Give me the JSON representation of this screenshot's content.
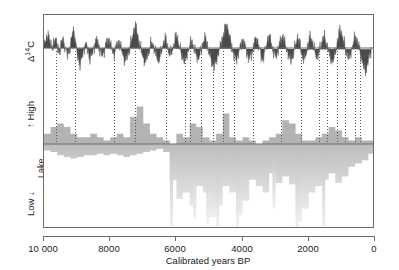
{
  "figure": {
    "name": "radiocarbon-lake-level-figure",
    "xaxis": {
      "title": "Calibrated years BP",
      "ticks": [
        "10 000",
        "8000",
        "6000",
        "4000",
        "2000",
        "0"
      ],
      "tick_values": [
        10000,
        8000,
        6000,
        4000,
        2000,
        0
      ],
      "reversed": true,
      "range": [
        10000,
        0
      ]
    },
    "yaxis": {
      "d14c_label_prefix": "Δ",
      "d14c_label_sup": "14",
      "d14c_label_suffix": "C",
      "high_label": "High",
      "low_label": "Low",
      "lake_label_line1": "Lake",
      "lake_label_line2": "level",
      "arrow_up": "↑",
      "arrow_down": "↓"
    },
    "colors": {
      "d14c": "#4a4a4a",
      "lake_high": "#b3b3b3",
      "lake_low_top": "#bdbdbd",
      "lake_low_bottom": "#f2f2f2",
      "frame": "#6b6b6b",
      "dotted_line": "#555555",
      "text": "#1a1a1a",
      "background": "#ffffff"
    }
  },
  "chart_data": {
    "type": "area",
    "title": "",
    "xlabel": "Calibrated years BP",
    "ylabel": "",
    "xlim": [
      10000,
      0
    ],
    "grid": false,
    "legend": "none",
    "panels": [
      {
        "name": "d14c-residual",
        "ylabel": "Δ14C",
        "type": "area",
        "color": "#4a4a4a",
        "baseline": 0,
        "note": "Atmospheric radiocarbon residual wiggles, positive up / negative down about zero line",
        "x": [
          10000,
          9950,
          9900,
          9850,
          9800,
          9750,
          9700,
          9650,
          9600,
          9550,
          9500,
          9450,
          9400,
          9350,
          9300,
          9250,
          9200,
          9150,
          9100,
          9050,
          9000,
          8950,
          8900,
          8850,
          8800,
          8750,
          8700,
          8650,
          8600,
          8550,
          8500,
          8450,
          8400,
          8350,
          8300,
          8250,
          8200,
          8150,
          8100,
          8050,
          8000,
          7950,
          7900,
          7850,
          7800,
          7750,
          7700,
          7650,
          7600,
          7550,
          7500,
          7450,
          7400,
          7350,
          7300,
          7250,
          7200,
          7150,
          7100,
          7050,
          7000,
          6950,
          6900,
          6850,
          6800,
          6750,
          6700,
          6650,
          6600,
          6550,
          6500,
          6450,
          6400,
          6350,
          6300,
          6250,
          6200,
          6150,
          6100,
          6050,
          6000,
          5950,
          5900,
          5850,
          5800,
          5750,
          5700,
          5650,
          5600,
          5550,
          5500,
          5450,
          5400,
          5350,
          5300,
          5250,
          5200,
          5150,
          5100,
          5050,
          5000,
          4950,
          4900,
          4850,
          4800,
          4750,
          4700,
          4650,
          4600,
          4550,
          4500,
          4450,
          4400,
          4350,
          4300,
          4250,
          4200,
          4150,
          4100,
          4050,
          4000,
          3950,
          3900,
          3850,
          3800,
          3750,
          3700,
          3650,
          3600,
          3550,
          3500,
          3450,
          3400,
          3350,
          3300,
          3250,
          3200,
          3150,
          3100,
          3050,
          3000,
          2950,
          2900,
          2850,
          2800,
          2750,
          2700,
          2650,
          2600,
          2550,
          2500,
          2450,
          2400,
          2350,
          2300,
          2250,
          2200,
          2150,
          2100,
          2050,
          2000,
          1950,
          1900,
          1850,
          1800,
          1750,
          1700,
          1650,
          1600,
          1550,
          1500,
          1450,
          1400,
          1350,
          1300,
          1250,
          1200,
          1150,
          1100,
          1050,
          1000,
          950,
          900,
          850,
          800,
          750,
          700,
          650,
          600,
          550,
          500,
          450,
          400,
          350,
          300,
          250,
          200,
          150,
          100,
          50,
          0
        ],
        "values": [
          14,
          10,
          18,
          22,
          6,
          -4,
          10,
          16,
          4,
          -6,
          2,
          12,
          8,
          -2,
          -10,
          -5,
          6,
          20,
          28,
          10,
          -8,
          -18,
          -26,
          -14,
          -4,
          6,
          2,
          -8,
          -16,
          -10,
          -2,
          8,
          14,
          6,
          -4,
          -12,
          -8,
          0,
          10,
          16,
          8,
          -2,
          -10,
          -6,
          4,
          12,
          6,
          -4,
          -14,
          -22,
          -16,
          -6,
          4,
          14,
          24,
          34,
          28,
          16,
          4,
          -6,
          -16,
          -24,
          -18,
          -8,
          2,
          10,
          4,
          -6,
          -14,
          -20,
          -14,
          -4,
          6,
          14,
          8,
          -2,
          -10,
          -6,
          2,
          10,
          18,
          12,
          2,
          -8,
          -16,
          -22,
          -16,
          -6,
          4,
          12,
          6,
          -4,
          -12,
          -18,
          -12,
          -2,
          8,
          16,
          10,
          0,
          -10,
          -18,
          -24,
          -30,
          -22,
          -12,
          -2,
          8,
          18,
          28,
          36,
          30,
          20,
          8,
          -2,
          -12,
          -20,
          -14,
          -4,
          6,
          14,
          8,
          -2,
          -12,
          -18,
          -12,
          -2,
          8,
          16,
          10,
          0,
          -10,
          -16,
          -10,
          0,
          10,
          18,
          12,
          2,
          -8,
          -14,
          -8,
          2,
          12,
          20,
          14,
          4,
          -6,
          -14,
          -20,
          -14,
          -4,
          6,
          16,
          10,
          0,
          -10,
          -18,
          -12,
          -2,
          8,
          18,
          12,
          2,
          -8,
          -16,
          -10,
          0,
          10,
          20,
          14,
          4,
          -6,
          -16,
          -22,
          -16,
          -6,
          6,
          18,
          28,
          22,
          12,
          2,
          -8,
          -18,
          -12,
          -2,
          10,
          20,
          14,
          4,
          -8,
          -18,
          -28,
          -36,
          -30,
          -20,
          -10,
          -2
        ]
      },
      {
        "name": "lake-level-high",
        "ylabel": "High",
        "type": "bar",
        "color": "#b3b3b3",
        "direction": "up",
        "note": "Periods of high lake level; bar height indicates number of sites / magnitude",
        "x": [
          10000,
          9800,
          9600,
          9400,
          9200,
          9000,
          8800,
          8600,
          8400,
          8200,
          8000,
          7800,
          7600,
          7400,
          7200,
          7000,
          6800,
          6600,
          6400,
          6200,
          6000,
          5800,
          5600,
          5400,
          5200,
          5000,
          4800,
          4600,
          4400,
          4200,
          4000,
          3800,
          3600,
          3400,
          3200,
          3000,
          2800,
          2600,
          2400,
          2200,
          2000,
          1800,
          1600,
          1400,
          1200,
          1000,
          800,
          600,
          400,
          200,
          0
        ],
        "values": [
          3,
          5,
          6,
          5,
          3,
          2,
          2,
          3,
          2,
          1,
          2,
          3,
          2,
          8,
          11,
          6,
          3,
          2,
          1,
          0,
          3,
          2,
          6,
          5,
          2,
          1,
          3,
          9,
          2,
          1,
          2,
          1,
          0,
          1,
          2,
          3,
          7,
          6,
          3,
          1,
          1,
          2,
          3,
          5,
          4,
          2,
          1,
          2,
          1,
          1,
          0
        ]
      },
      {
        "name": "lake-level-low",
        "ylabel": "Low",
        "type": "bar",
        "color_top": "#bdbdbd",
        "color_bottom": "#f2f2f2",
        "direction": "down",
        "note": "Periods of low lake level; bars extend downward, shaded with vertical gradient",
        "x": [
          10000,
          9800,
          9600,
          9400,
          9200,
          9000,
          8800,
          8600,
          8400,
          8200,
          8000,
          7800,
          7600,
          7400,
          7200,
          7000,
          6800,
          6600,
          6400,
          6200,
          6000,
          5800,
          5600,
          5400,
          5200,
          5000,
          4800,
          4600,
          4400,
          4200,
          4000,
          3800,
          3600,
          3400,
          3200,
          3000,
          2800,
          2600,
          2400,
          2200,
          2000,
          1800,
          1600,
          1400,
          1200,
          1000,
          800,
          600,
          400,
          200,
          0
        ],
        "values": [
          4,
          5,
          7,
          8,
          9,
          8,
          7,
          7,
          6,
          7,
          6,
          7,
          8,
          7,
          6,
          5,
          4,
          3,
          5,
          22,
          34,
          30,
          38,
          26,
          30,
          45,
          38,
          26,
          30,
          44,
          35,
          22,
          26,
          30,
          18,
          24,
          20,
          25,
          48,
          40,
          30,
          26,
          22,
          18,
          24,
          20,
          14,
          12,
          10,
          6,
          3
        ]
      }
    ],
    "connector_lines": {
      "name": "dotted-correlation-lines",
      "style": "dotted",
      "color": "#555555",
      "note": "Dotted vertical lines link radiocarbon anomalies to lake-level highs",
      "x": [
        9650,
        9050,
        7900,
        7250,
        6300,
        5750,
        5600,
        5250,
        4900,
        4600,
        4250,
        3700,
        2850,
        2250,
        1700,
        1450,
        1150,
        900,
        600,
        450
      ]
    }
  }
}
